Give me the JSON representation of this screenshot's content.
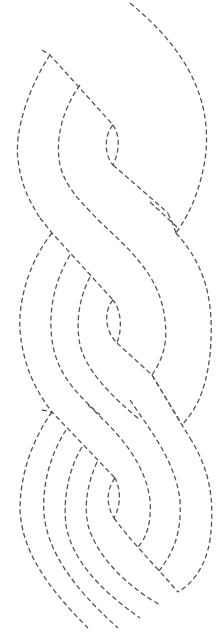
{
  "design": {
    "name": "dashed braided cable pattern",
    "background": "#ffffff",
    "stroke_color": "#555555",
    "dash_pattern": [
      5,
      3
    ],
    "stroke_width": 1.3
  },
  "paths": [
    {
      "id": "outer-right-arc",
      "d": "M130 3 C175 40 215 90 205 160 C198 200 185 220 176 233"
    },
    {
      "id": "top-band-upper",
      "d": "M42 50 L50 55 L113 125"
    },
    {
      "id": "top-left-outer-arc",
      "d": "M50 55 C30 85 14 130 18 160 C22 190 32 205 40 218"
    },
    {
      "id": "top-left-inner-arc",
      "d": "M80 85 C62 110 55 140 60 165 C66 190 85 205 98 220"
    },
    {
      "id": "top-loop",
      "d": "M113 125 C104 135 104 155 113 165 C120 150 120 135 113 125"
    },
    {
      "id": "top-band-lower",
      "d": "M113 165 L168 213"
    },
    {
      "id": "middle-right-arc",
      "d": "M176 233 C172 220 168 215 168 213 M176 233 C205 265 215 300 210 355 C205 395 195 410 182 425"
    },
    {
      "id": "middle-band-from-top-outer",
      "d": "M30 0 M40 218 L52 233 L113 300"
    },
    {
      "id": "middle-band-from-top-inner",
      "d": "M98 220 C130 250 160 275 165 320 C168 345 162 360 152 375"
    },
    {
      "id": "middle-band-right-top",
      "d": "M150 202 L178 228"
    },
    {
      "id": "middle-left-outer-arc",
      "d": "M52 233 C30 260 18 300 20 330 C23 365 35 390 52 412"
    },
    {
      "id": "middle-left-mid-arc",
      "d": "M70 255 C55 280 48 310 52 340 C56 370 72 390 100 415"
    },
    {
      "id": "middle-left-inner-arc",
      "d": "M90 277 C78 300 76 325 80 345 C86 370 110 395 140 420"
    },
    {
      "id": "middle-loop",
      "d": "M113 300 C104 310 104 330 117 343 C122 330 122 312 113 300"
    },
    {
      "id": "middle-band-lower",
      "d": "M117 343 L152 375 L182 425"
    },
    {
      "id": "middle-band-lower-2",
      "d": "M152 375 L182 425 L190 438"
    },
    {
      "id": "bottom-right-arc",
      "d": "M190 438 C210 470 215 500 210 540 C205 570 190 585 178 592"
    },
    {
      "id": "bottom-inner-right-arc",
      "d": "M130 400 C150 430 175 460 180 500 C182 535 172 555 158 572"
    },
    {
      "id": "bottom-mid-right-arc",
      "d": "M88 405 C115 430 145 460 150 500 C152 525 145 540 137 548"
    },
    {
      "id": "bottom-band-upper",
      "d": "M42 410 L52 412 L115 478"
    },
    {
      "id": "bottom-left-arc-1",
      "d": "M52 412 C32 440 20 475 20 510 C22 550 45 585 88 628"
    },
    {
      "id": "bottom-left-arc-2",
      "d": "M66 430 C50 455 42 485 44 515 C48 550 70 585 118 628"
    },
    {
      "id": "bottom-left-arc-3",
      "d": "M82 447 C68 470 63 500 66 525 C72 560 100 590 140 618"
    },
    {
      "id": "bottom-left-arc-4",
      "d": "M97 462 C87 485 84 505 88 525 C96 555 125 585 160 605"
    },
    {
      "id": "bottom-loop",
      "d": "M115 478 C106 490 106 505 114 518 C121 505 121 490 115 478"
    },
    {
      "id": "bottom-band-lower",
      "d": "M114 518 C130 540 150 560 178 592"
    }
  ]
}
